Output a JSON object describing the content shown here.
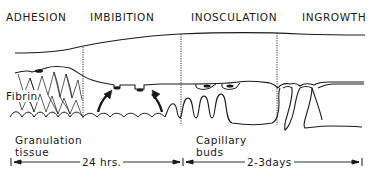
{
  "figure": {
    "phases": [
      {
        "id": "adhesion",
        "label": "ADHESION"
      },
      {
        "id": "imbibition",
        "label": "IMBIBITION"
      },
      {
        "id": "inosculation",
        "label": "INOSCULATION"
      },
      {
        "id": "ingrowth",
        "label": "INGROWTH"
      }
    ],
    "annotations": {
      "fibrin": "Fibrin",
      "granulation_line1": "Granulation",
      "granulation_line2": "tissue",
      "capillary_line1": "Capillary",
      "capillary_line2": "buds"
    },
    "timeline": [
      {
        "id": "first-24h",
        "label": "24 hrs."
      },
      {
        "id": "days-2-3",
        "label": "2-3days"
      }
    ],
    "colors": {
      "ink": "#1a1a1a",
      "background": "#ffffff"
    }
  }
}
